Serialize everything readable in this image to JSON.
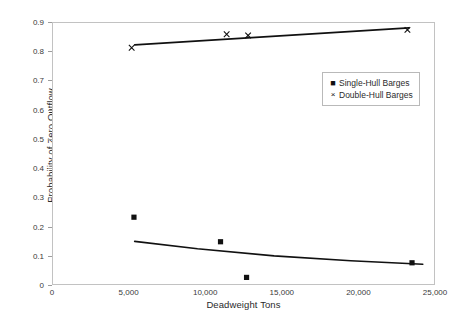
{
  "chart_data": {
    "type": "scatter",
    "title": "",
    "xlabel": "Deadweight Tons",
    "ylabel": "Probability of Zero Outflow",
    "xlim": [
      0,
      25000
    ],
    "ylim": [
      0,
      0.9
    ],
    "grid": false,
    "legend_position": "upper-right-inside",
    "xticks": [
      {
        "value": 0,
        "label": "0"
      },
      {
        "value": 5000,
        "label": "5,000"
      },
      {
        "value": 10000,
        "label": "10,000"
      },
      {
        "value": 15000,
        "label": "15,000"
      },
      {
        "value": 20000,
        "label": "20,000"
      },
      {
        "value": 25000,
        "label": "25,000"
      }
    ],
    "yticks": [
      {
        "value": 0,
        "label": "0"
      },
      {
        "value": 0.1,
        "label": "0.1"
      },
      {
        "value": 0.2,
        "label": "0.2"
      },
      {
        "value": 0.3,
        "label": "0.3"
      },
      {
        "value": 0.4,
        "label": "0.4"
      },
      {
        "value": 0.5,
        "label": "0.5"
      },
      {
        "value": 0.6,
        "label": "0.6"
      },
      {
        "value": 0.7,
        "label": "0.7"
      },
      {
        "value": 0.8,
        "label": "0.8"
      },
      {
        "value": 0.9,
        "label": "0.9"
      }
    ],
    "series": [
      {
        "name": "Single-Hull Barges",
        "marker": "filled-square",
        "color": "#111111",
        "points": [
          {
            "x": 5350,
            "y": 0.232
          },
          {
            "x": 11000,
            "y": 0.148
          },
          {
            "x": 12700,
            "y": 0.026
          },
          {
            "x": 23500,
            "y": 0.076
          }
        ],
        "trendline": [
          {
            "x": 5400,
            "y": 0.149
          },
          {
            "x": 9500,
            "y": 0.124
          },
          {
            "x": 14500,
            "y": 0.1
          },
          {
            "x": 19500,
            "y": 0.083
          },
          {
            "x": 24200,
            "y": 0.071
          }
        ]
      },
      {
        "name": "Double-Hull Barges",
        "marker": "cross",
        "color": "#111111",
        "points": [
          {
            "x": 5200,
            "y": 0.812
          },
          {
            "x": 11400,
            "y": 0.858
          },
          {
            "x": 12800,
            "y": 0.854
          },
          {
            "x": 23200,
            "y": 0.873
          }
        ],
        "trendline": [
          {
            "x": 5400,
            "y": 0.822
          },
          {
            "x": 23300,
            "y": 0.88
          }
        ]
      }
    ]
  },
  "legend": {
    "items": [
      {
        "symbol": "■",
        "label": "Single-Hull Barges"
      },
      {
        "symbol": "×",
        "label": "Double-Hull Barges"
      }
    ]
  }
}
